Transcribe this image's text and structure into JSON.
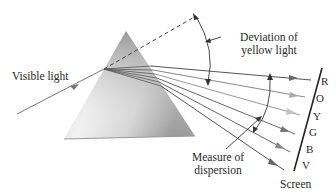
{
  "diagram": {
    "labels": {
      "incident": "Visible light",
      "deviation_line1": "Deviation of",
      "deviation_line2": "yellow light",
      "dispersion_line1": "Measure of",
      "dispersion_line2": "dispersion",
      "screen": "Screen"
    },
    "spectrum": [
      {
        "letter": "R",
        "name": "red",
        "color": "#555555"
      },
      {
        "letter": "O",
        "name": "orange",
        "color": "#999999"
      },
      {
        "letter": "Y",
        "name": "yellow",
        "color": "#bbbbbb"
      },
      {
        "letter": "G",
        "name": "green",
        "color": "#777777"
      },
      {
        "letter": "B",
        "name": "blue",
        "color": "#888888"
      },
      {
        "letter": "V",
        "name": "violet",
        "color": "#555555"
      }
    ],
    "colors": {
      "line": "#444444",
      "prism_light": "#f4f4f4",
      "prism_dark": "#8a8a8a"
    }
  }
}
